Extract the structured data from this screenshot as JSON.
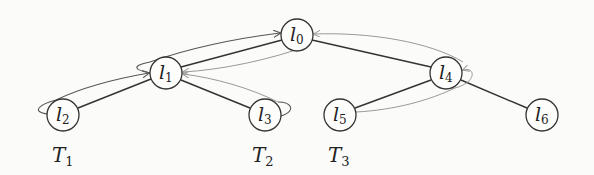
{
  "diagram": {
    "nodes": [
      {
        "id": "l0",
        "label": "l",
        "sub": "0",
        "x": 297,
        "y": 35
      },
      {
        "id": "l1",
        "label": "l",
        "sub": "1",
        "x": 166,
        "y": 73
      },
      {
        "id": "l2",
        "label": "l",
        "sub": "2",
        "x": 63,
        "y": 115
      },
      {
        "id": "l3",
        "label": "l",
        "sub": "3",
        "x": 265,
        "y": 115
      },
      {
        "id": "l4",
        "label": "l",
        "sub": "4",
        "x": 446,
        "y": 73
      },
      {
        "id": "l5",
        "label": "l",
        "sub": "5",
        "x": 340,
        "y": 115
      },
      {
        "id": "l6",
        "label": "l",
        "sub": "6",
        "x": 542,
        "y": 115
      }
    ],
    "edges": [
      {
        "from": "l0",
        "to": "l1"
      },
      {
        "from": "l1",
        "to": "l2"
      },
      {
        "from": "l1",
        "to": "l3"
      },
      {
        "from": "l0",
        "to": "l4"
      },
      {
        "from": "l4",
        "to": "l5"
      },
      {
        "from": "l4",
        "to": "l6"
      }
    ],
    "traversal_labels": [
      {
        "id": "T1",
        "label": "T",
        "sub": "1",
        "x": 52,
        "y": 162
      },
      {
        "id": "T2",
        "label": "T",
        "sub": "2",
        "x": 252,
        "y": 162
      },
      {
        "id": "T3",
        "label": "T",
        "sub": "3",
        "x": 328,
        "y": 162
      }
    ]
  }
}
